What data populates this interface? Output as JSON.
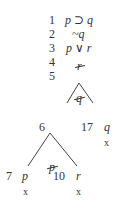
{
  "trunk": [
    {
      "num": "1",
      "formula": "p ⊃ q",
      "ticked": false
    },
    {
      "num": "2",
      "formula": "~q",
      "ticked": false
    },
    {
      "num": "3",
      "formula": "p ∨ r",
      "ticked": false
    },
    {
      "num": "4",
      "formula": "r",
      "ticked": true
    },
    {
      "num": "5",
      "formula": "q",
      "ticked": true
    }
  ],
  "branch1": {
    "left": {
      "num": "6",
      "formula": "p",
      "ticked": true
    },
    "right": {
      "num": "17",
      "formula": "q",
      "closed": "x"
    }
  },
  "branch2": {
    "left": {
      "num": "7",
      "formula": "p",
      "closed": "x"
    },
    "right": {
      "num": "10",
      "formula": "r",
      "closed": "x"
    }
  }
}
